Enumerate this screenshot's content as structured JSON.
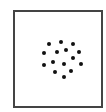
{
  "figure": {
    "frame": {
      "left": 13,
      "top": 10,
      "right": 101,
      "bottom": 106,
      "border_color": "#444444"
    },
    "dot_color": "#111111",
    "dot_count": 15,
    "dots": [
      {
        "x": 49,
        "y": 44
      },
      {
        "x": 61,
        "y": 42
      },
      {
        "x": 73,
        "y": 44
      },
      {
        "x": 44,
        "y": 53
      },
      {
        "x": 57,
        "y": 52
      },
      {
        "x": 66,
        "y": 50
      },
      {
        "x": 79,
        "y": 52
      },
      {
        "x": 73,
        "y": 58
      },
      {
        "x": 44,
        "y": 65
      },
      {
        "x": 53,
        "y": 62
      },
      {
        "x": 64,
        "y": 64
      },
      {
        "x": 81,
        "y": 64
      },
      {
        "x": 55,
        "y": 72
      },
      {
        "x": 71,
        "y": 71
      },
      {
        "x": 64,
        "y": 77
      }
    ]
  }
}
